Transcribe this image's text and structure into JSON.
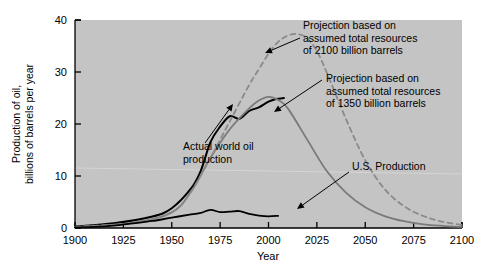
{
  "chart_data": {
    "type": "line",
    "title": "",
    "xlabel": "Year",
    "ylabel": "Production of oil, billions of barrels per year",
    "ylabel_line1": "Production of oil,",
    "ylabel_line2": "billions of barrels per year",
    "xlim": [
      1900,
      2100
    ],
    "ylim": [
      0,
      40
    ],
    "xticks": [
      1900,
      1925,
      1950,
      1975,
      2000,
      2025,
      2050,
      2075,
      2100
    ],
    "xtick_labels": [
      "1900",
      "1925",
      "1950",
      "1975",
      "2000",
      "2025",
      "2050",
      "2075",
      "2100"
    ],
    "yticks": [
      0,
      10,
      20,
      30,
      40
    ],
    "ytick_labels": [
      "0",
      "10",
      "20",
      "30",
      "40"
    ],
    "grid": false,
    "legend_position": "none",
    "plot_bgcolor": "#c4c4c4",
    "page_bgcolor": "#ffffff",
    "series": [
      {
        "name": "Actual world oil production",
        "style": "solid",
        "color": "#000000",
        "width": 2.0,
        "x": [
          1900,
          1920,
          1940,
          1950,
          1960,
          1965,
          1970,
          1975,
          1980,
          1985,
          1990,
          1995,
          2000,
          2004,
          2008
        ],
        "y": [
          0.3,
          0.9,
          2.2,
          3.8,
          7.6,
          11.0,
          16.5,
          19.5,
          21.5,
          21.0,
          22.5,
          23.2,
          24.3,
          24.8,
          25.0
        ]
      },
      {
        "name": "Projection based on assumed total resources of 1350 billion barrels",
        "style": "solid",
        "color": "#7a7a7a",
        "width": 1.8,
        "x": [
          1900,
          1930,
          1950,
          1960,
          1970,
          1980,
          1990,
          1995,
          2000,
          2005,
          2010,
          2020,
          2030,
          2040,
          2050,
          2060,
          2070,
          2080,
          2090,
          2100
        ],
        "y": [
          0.2,
          1.0,
          3.0,
          7.0,
          13.5,
          19.0,
          23.0,
          24.5,
          25.2,
          24.6,
          23.0,
          17.0,
          11.0,
          6.8,
          4.0,
          2.3,
          1.3,
          0.7,
          0.4,
          0.2
        ]
      },
      {
        "name": "Projection based on assumed total resources of 2100 billion barrels",
        "style": "dashed",
        "color": "#8a8a8a",
        "width": 1.8,
        "x": [
          1900,
          1930,
          1950,
          1960,
          1970,
          1980,
          1990,
          1995,
          2000,
          2005,
          2010,
          2015,
          2020,
          2025,
          2030,
          2040,
          2050,
          2060,
          2070,
          2080,
          2090,
          2100
        ],
        "y": [
          0.2,
          1.0,
          3.0,
          7.0,
          13.5,
          20.5,
          27.5,
          30.5,
          33.5,
          35.8,
          37.0,
          37.3,
          36.5,
          34.0,
          30.0,
          21.0,
          13.0,
          7.5,
          4.2,
          2.3,
          1.2,
          0.6
        ]
      },
      {
        "name": "U.S. Production",
        "style": "solid",
        "color": "#000000",
        "width": 1.8,
        "x": [
          1900,
          1910,
          1920,
          1930,
          1940,
          1950,
          1960,
          1965,
          1970,
          1975,
          1980,
          1985,
          1990,
          1995,
          2000,
          2005
        ],
        "y": [
          0.1,
          0.2,
          0.45,
          0.9,
          1.35,
          2.0,
          2.6,
          2.9,
          3.5,
          3.05,
          3.15,
          3.25,
          2.7,
          2.4,
          2.25,
          2.35
        ]
      }
    ],
    "annotations": [
      {
        "id": "annotation-projection-2100",
        "lines": [
          "Projection based on",
          "assumed total resources",
          "of 2100 billion barrels"
        ],
        "text": "Projection based on assumed total resources of 2100 billion barrels",
        "text_x": 303,
        "text_y": 29,
        "arrow_from_x": 300,
        "arrow_from_y": 38,
        "arrow_to_x": 265,
        "arrow_to_y": 53,
        "has_arrow": true
      },
      {
        "id": "annotation-projection-1350",
        "lines": [
          "Projection based on",
          "assumed total resources",
          "of 1350 billion barrels"
        ],
        "text": "Projection based on assumed total resources of 1350 billion barrels",
        "text_x": 326,
        "text_y": 82,
        "arrow_from_x": 322,
        "arrow_from_y": 80,
        "arrow_to_x": 274,
        "arrow_to_y": 112,
        "has_arrow": true
      },
      {
        "id": "annotation-actual-world-oil",
        "lines": [
          "Actual world oil",
          "production"
        ],
        "text": "Actual world oil production",
        "text_x": 183,
        "text_y": 150,
        "arrow_from_x": 205,
        "arrow_from_y": 143,
        "arrow_to_x": 233,
        "arrow_to_y": 104,
        "has_arrow": true
      },
      {
        "id": "annotation-us-production",
        "lines": [
          "U.S. Production"
        ],
        "text": "U.S. Production",
        "text_x": 352,
        "text_y": 170,
        "arrow_from_x": 349,
        "arrow_from_y": 172,
        "arrow_to_x": 297,
        "arrow_to_y": 209,
        "has_arrow": true
      }
    ]
  }
}
